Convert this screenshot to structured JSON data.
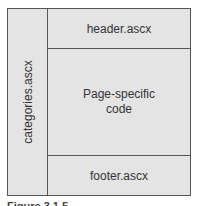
{
  "diagram": {
    "sidebar_label": "categories.ascx",
    "header_label": "header.ascx",
    "content_label": "Page-specific code",
    "footer_label": "footer.ascx",
    "caption": "Figure 3.1.5"
  }
}
